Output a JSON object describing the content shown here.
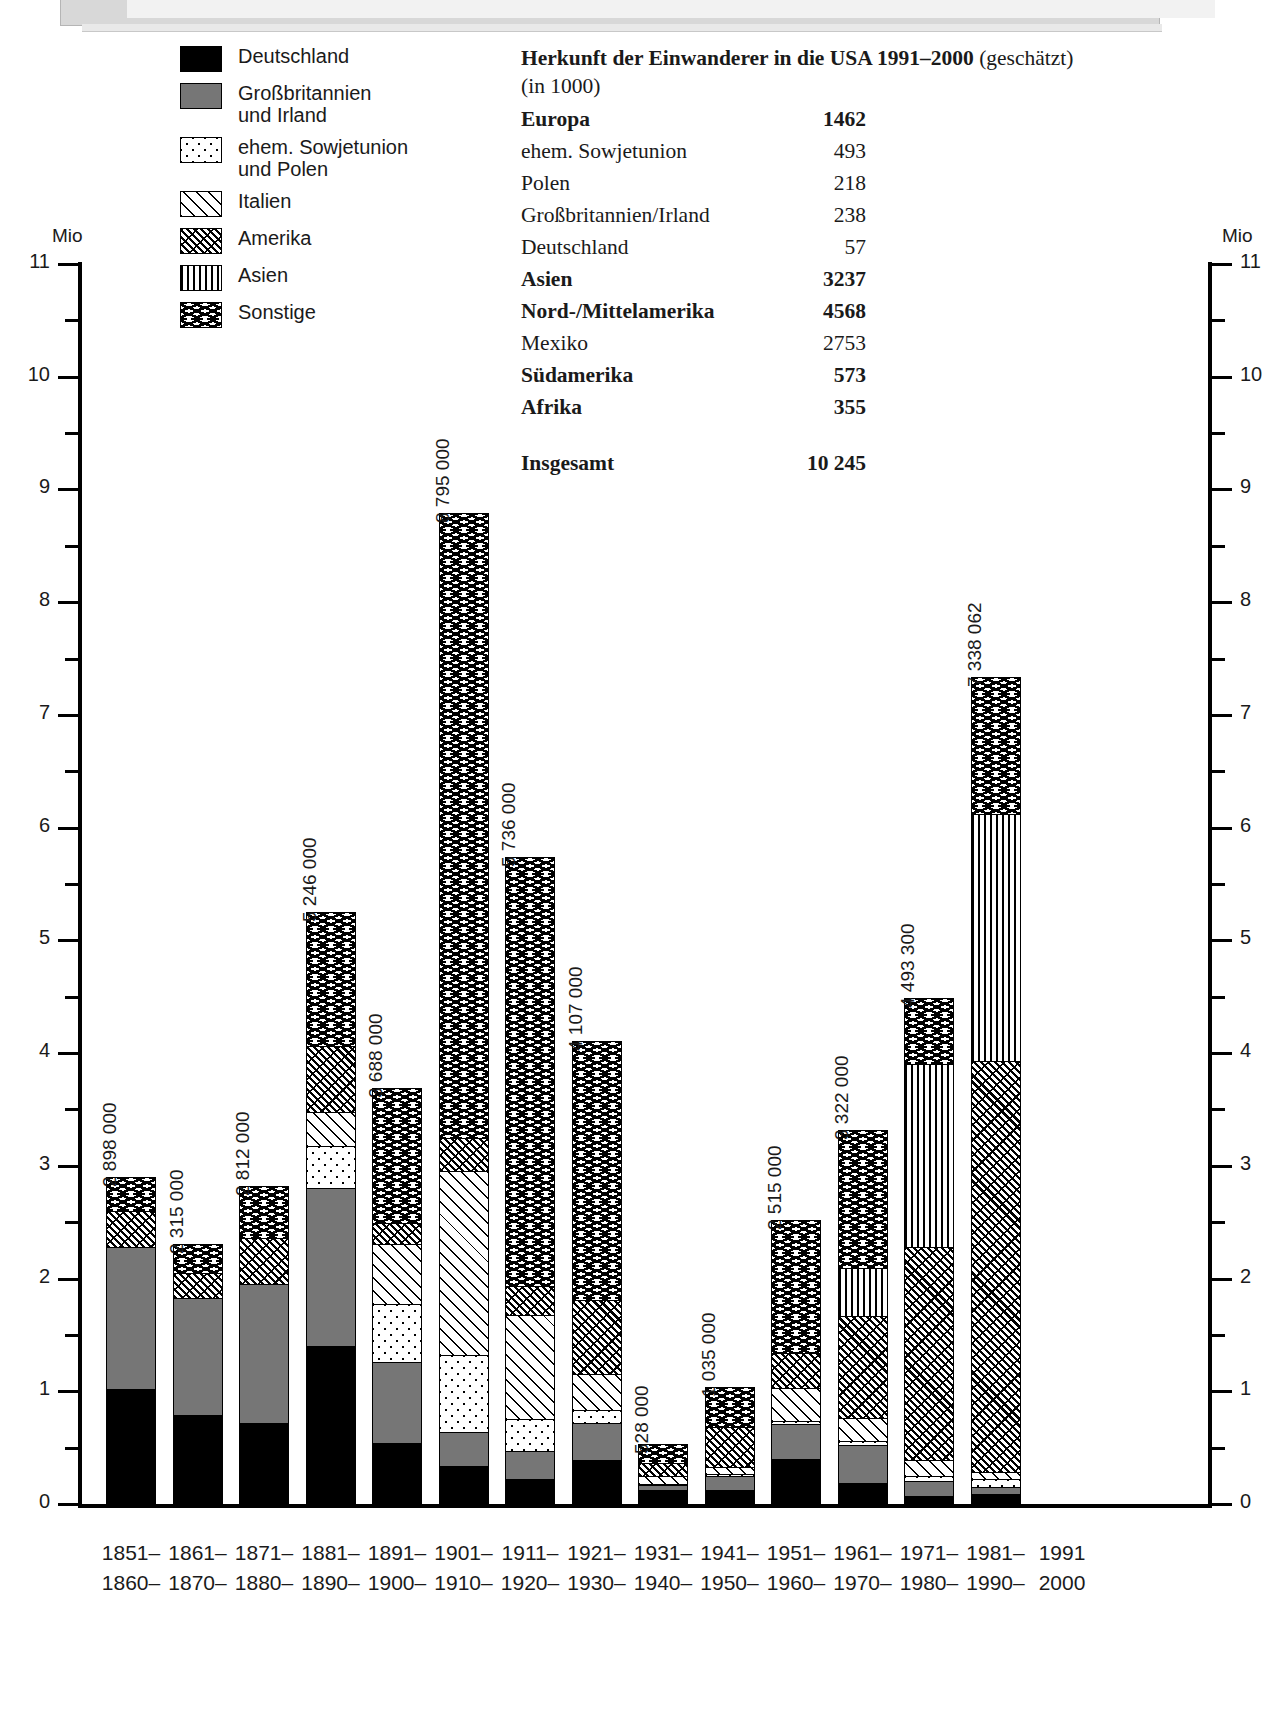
{
  "legend": {
    "items": [
      {
        "label": "Deutschland",
        "pattern": "solid-black"
      },
      {
        "label": "Großbritannien\nund Irland",
        "pattern": "grey"
      },
      {
        "label": "ehem. Sowjetunion\nund Polen",
        "pattern": "dots"
      },
      {
        "label": "Italien",
        "pattern": "diagonal"
      },
      {
        "label": "Amerika",
        "pattern": "diagonal-dot"
      },
      {
        "label": "Asien",
        "pattern": "vertical"
      },
      {
        "label": "Sonstige",
        "pattern": "wave"
      }
    ]
  },
  "table": {
    "title_bold": "Herkunft der Einwanderer in die USA 1991–2000",
    "title_rest": " (geschätzt)",
    "subtitle": "(in 1000)",
    "rows": [
      {
        "label": "Europa",
        "value": "1462",
        "bold": true
      },
      {
        "label": "ehem. Sowjetunion",
        "value": "493",
        "bold": false
      },
      {
        "label": "Polen",
        "value": "218",
        "bold": false
      },
      {
        "label": "Großbritannien/Irland",
        "value": "238",
        "bold": false
      },
      {
        "label": "Deutschland",
        "value": "57",
        "bold": false
      },
      {
        "label": "Asien",
        "value": "3237",
        "bold": true
      },
      {
        "label": "Nord-/Mittelamerika",
        "value": "4568",
        "bold": true
      },
      {
        "label": "Mexiko",
        "value": "2753",
        "bold": false
      },
      {
        "label": "Südamerika",
        "value": "573",
        "bold": true
      },
      {
        "label": "Afrika",
        "value": "355",
        "bold": true
      }
    ],
    "total": {
      "label": "Insgesamt",
      "value": "10 245"
    }
  },
  "axis": {
    "unit_left": "Mio",
    "unit_right": "Mio",
    "major_ticks": [
      "11",
      "10",
      "9",
      "8",
      "7",
      "6",
      "5",
      "4",
      "3",
      "2",
      "1",
      "0"
    ],
    "ymin": 0,
    "ymax": 11
  },
  "chart_data": {
    "type": "bar",
    "xlabel": "",
    "ylabel": "Mio",
    "ylim": [
      0,
      11
    ],
    "grid": false,
    "legend_position": "top-left",
    "stacked": true,
    "unit": "Personen",
    "categories": [
      "1851–\n1860–",
      "1861–\n1870–",
      "1871–\n1880–",
      "1881–\n1890–",
      "1891–\n1900–",
      "1901–\n1910–",
      "1911–\n1920–",
      "1921–\n1930–",
      "1931–\n1940–",
      "1941–\n1950–",
      "1951–\n1960–",
      "1961–\n1970–",
      "1971–\n1980–",
      "1981–\n1990–",
      "1991\n2000"
    ],
    "totals_labels": [
      "2 898 000",
      "2 315 000",
      "2 812 000",
      "5 246 000",
      "3 688 000",
      "8 795 000",
      "5 736 000",
      "4 107 000",
      "528 000",
      "1 035 000",
      "2 515 000",
      "3 322 000",
      "4 493 300",
      "7 338 062",
      ""
    ],
    "totals": [
      2898000,
      2315000,
      2812000,
      5246000,
      3688000,
      8795000,
      5736000,
      4107000,
      528000,
      1035000,
      2515000,
      3322000,
      4493300,
      7338062,
      null
    ],
    "series": [
      {
        "name": "Deutschland",
        "pattern": "solid-black",
        "values": [
          1.02,
          0.79,
          0.72,
          1.4,
          0.54,
          0.34,
          0.22,
          0.39,
          0.12,
          0.12,
          0.4,
          0.19,
          0.07,
          0.09,
          null
        ]
      },
      {
        "name": "Großbritannien und Irland",
        "pattern": "grey",
        "values": [
          1.26,
          1.04,
          1.23,
          1.4,
          0.72,
          0.3,
          0.25,
          0.33,
          0.05,
          0.13,
          0.31,
          0.33,
          0.13,
          0.06,
          null
        ]
      },
      {
        "name": "ehem. Sowjetunion und Polen",
        "pattern": "dots",
        "values": [
          0.0,
          0.0,
          0.0,
          0.38,
          0.51,
          0.68,
          0.28,
          0.11,
          0.01,
          0.02,
          0.03,
          0.04,
          0.05,
          0.07,
          null
        ]
      },
      {
        "name": "Italien",
        "pattern": "diagonal",
        "values": [
          0.0,
          0.0,
          0.0,
          0.3,
          0.54,
          1.63,
          0.93,
          0.32,
          0.07,
          0.06,
          0.29,
          0.2,
          0.14,
          0.06,
          null
        ]
      },
      {
        "name": "Amerika",
        "pattern": "diagonal-dot",
        "values": [
          0.32,
          0.22,
          0.41,
          0.58,
          0.18,
          0.3,
          0.25,
          0.66,
          0.11,
          0.35,
          0.31,
          0.91,
          1.89,
          3.65,
          null
        ]
      },
      {
        "name": "Asien",
        "pattern": "vertical",
        "values": [
          0.0,
          0.0,
          0.0,
          0.0,
          0.0,
          0.0,
          0.0,
          0.0,
          0.0,
          0.0,
          0.0,
          0.42,
          1.62,
          2.19,
          null
        ]
      },
      {
        "name": "Sonstige",
        "pattern": "wave",
        "values": [
          0.3,
          0.26,
          0.46,
          1.19,
          1.2,
          5.54,
          3.81,
          2.3,
          0.17,
          0.36,
          1.18,
          1.23,
          0.59,
          1.22,
          null
        ]
      }
    ]
  }
}
